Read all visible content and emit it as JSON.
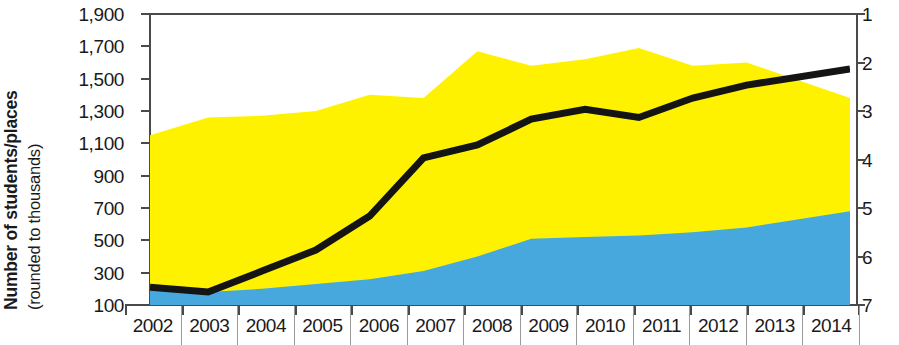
{
  "chart_data": {
    "type": "area",
    "title": "",
    "ylabel": "Number of students/places (rounded to thousands)",
    "ylabel_main": "Number of students/places",
    "ylabel_sub": "(rounded to thousands)",
    "xlabel": "",
    "categories": [
      "2002",
      "2003",
      "2004",
      "2005",
      "2006",
      "2007",
      "2008",
      "2009",
      "2010",
      "2011",
      "2012",
      "2013",
      "2014"
    ],
    "ylim": [
      100,
      1900
    ],
    "ytick_labels": [
      "1,900",
      "1,700",
      "1,500",
      "1,300",
      "1,100",
      "900",
      "700",
      "500",
      "300",
      "100"
    ],
    "ytick_values": [
      1900,
      1700,
      1500,
      1300,
      1100,
      900,
      700,
      500,
      300,
      100
    ],
    "y2lim": [
      1,
      7
    ],
    "y2tick_labels": [
      "1",
      "2",
      "3",
      "4",
      "5",
      "6",
      "7"
    ],
    "y2tick_values": [
      1,
      2,
      3,
      4,
      5,
      6,
      7
    ],
    "grid": false,
    "legend": "none",
    "stacked": true,
    "series": [
      {
        "name": "blue-band",
        "type": "area",
        "color": "#46a8dc",
        "stack_order": 1,
        "values": [
          190,
          180,
          200,
          230,
          260,
          310,
          400,
          510,
          520,
          530,
          550,
          580,
          680
        ]
      },
      {
        "name": "yellow-band",
        "type": "area",
        "color": "#fff200",
        "stack_order": 2,
        "cumulative_top": [
          1150,
          1260,
          1270,
          1300,
          1400,
          1380,
          1670,
          1580,
          1620,
          1690,
          1580,
          1600,
          1380
        ],
        "values": [
          960,
          1080,
          1070,
          1070,
          1140,
          1070,
          1270,
          1070,
          1100,
          1160,
          1030,
          1020,
          700
        ]
      },
      {
        "name": "black-line",
        "type": "line",
        "color": "#141414",
        "axis": "left",
        "values": [
          210,
          180,
          310,
          440,
          650,
          1010,
          1090,
          1250,
          1310,
          1260,
          1380,
          1460,
          1560
        ]
      }
    ]
  },
  "axes": {
    "left_title_main": "Number of students/places",
    "left_title_sub": "(rounded to thousands)",
    "left_ticks": [
      "1,900",
      "1,700",
      "1,500",
      "1,300",
      "1,100",
      "900",
      "700",
      "500",
      "300",
      "100"
    ],
    "right_ticks": [
      "1",
      "2",
      "3",
      "4",
      "5",
      "6",
      "7"
    ],
    "x_ticks": [
      "2002",
      "2003",
      "2004",
      "2005",
      "2006",
      "2007",
      "2008",
      "2009",
      "2010",
      "2011",
      "2012",
      "2013",
      "2014"
    ]
  },
  "colors": {
    "band_yellow": "#fff200",
    "band_blue": "#46a8dc",
    "line_black": "#141414",
    "axis": "#4a4a4a",
    "text": "#1a1a1a",
    "background": "#ffffff"
  }
}
